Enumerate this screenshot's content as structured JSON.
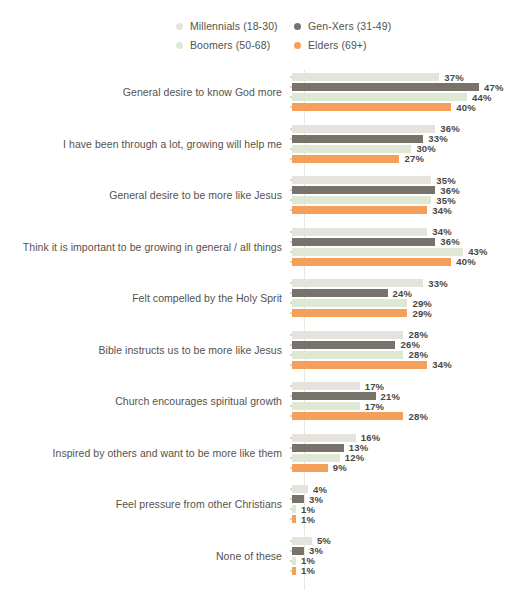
{
  "chart_data": {
    "type": "bar",
    "orientation": "horizontal",
    "grouped": true,
    "title": "",
    "xlabel": "",
    "ylabel": "",
    "grid": false,
    "legend_position": "top",
    "value_suffix": "%",
    "xlim": [
      0,
      50
    ],
    "categories": [
      "General desire to know God more",
      "I have been through a lot, growing will help me",
      "General desire to be more like Jesus",
      "Think it is important to be growing in general / all things",
      "Felt compelled by the Holy Sprit",
      "Bible instructs us to be more like Jesus",
      "Church encourages spiritual growth",
      "Inspired by others and want to be more like them",
      "Feel pressure from other Christians",
      "None of these"
    ],
    "series": [
      {
        "name": "Millennials (18-30)",
        "color": "#e5e3de",
        "values": [
          37,
          36,
          35,
          34,
          33,
          28,
          17,
          16,
          4,
          5
        ],
        "labels": [
          "37%",
          "36%",
          "35%",
          "34%",
          "33%",
          "28%",
          "17%",
          "16%",
          "4%",
          "5%"
        ]
      },
      {
        "name": "Gen-Xers (31-49)",
        "color": "#77736a",
        "values": [
          47,
          33,
          36,
          36,
          24,
          26,
          21,
          13,
          3,
          3
        ],
        "labels": [
          "47%",
          "33%",
          "36%",
          "36%",
          "24%",
          "26%",
          "21%",
          "13%",
          "3%",
          "3%"
        ]
      },
      {
        "name": "Boomers (50-68)",
        "color": "#dfe8d4",
        "values": [
          44,
          30,
          35,
          43,
          29,
          28,
          17,
          12,
          1,
          1
        ],
        "labels": [
          "44%",
          "30%",
          "35%",
          "43%",
          "29%",
          "28%",
          "17%",
          "12%",
          "1%",
          "1%"
        ]
      },
      {
        "name": "Elders (69+)",
        "color": "#f5a05a",
        "values": [
          40,
          27,
          34,
          40,
          29,
          34,
          28,
          9,
          1,
          1
        ],
        "labels": [
          "40%",
          "27%",
          "34%",
          "40%",
          "29%",
          "34%",
          "28%",
          "9%",
          "1%",
          "1%"
        ]
      }
    ]
  },
  "legend": {
    "items": [
      {
        "label": "Millennials (18-30)",
        "color": "#e5e3de"
      },
      {
        "label": "Gen-Xers (31-49)",
        "color": "#77736a"
      },
      {
        "label": "Boomers (50-68)",
        "color": "#dfe8d4"
      },
      {
        "label": "Elders (69+)",
        "color": "#f5a05a"
      }
    ]
  }
}
